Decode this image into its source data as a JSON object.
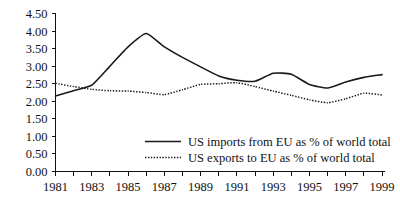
{
  "chart_data": {
    "type": "line",
    "title": "",
    "subtitle": "",
    "xlabel": "",
    "ylabel": "",
    "x": [
      1981,
      1982,
      1983,
      1984,
      1985,
      1986,
      1987,
      1988,
      1989,
      1990,
      1991,
      1992,
      1993,
      1994,
      1995,
      1996,
      1997,
      1998,
      1999
    ],
    "xlim": [
      1981,
      1999
    ],
    "ylim": [
      0.0,
      4.5
    ],
    "ytick_labels": [
      "0.00",
      "0.50",
      "1.00",
      "1.50",
      "2.00",
      "2.50",
      "3.00",
      "3.50",
      "4.00",
      "4.50"
    ],
    "ytick_values": [
      0.0,
      0.5,
      1.0,
      1.5,
      2.0,
      2.5,
      3.0,
      3.5,
      4.0,
      4.5
    ],
    "xtick_labels": [
      "1981",
      "1983",
      "1985",
      "1987",
      "1989",
      "1991",
      "1993",
      "1995",
      "1997",
      "1999"
    ],
    "xtick_values": [
      1981,
      1983,
      1985,
      1987,
      1989,
      1991,
      1993,
      1995,
      1997,
      1999
    ],
    "minor_xticks_every_year": true,
    "grid": false,
    "legend_position": "inside-center-lower",
    "series": [
      {
        "name": "US imports from EU as % of world total",
        "style": "solid",
        "color": "#1a1a1a",
        "values": [
          2.15,
          2.3,
          2.46,
          3.0,
          3.55,
          3.93,
          3.55,
          3.25,
          2.98,
          2.72,
          2.6,
          2.57,
          2.8,
          2.77,
          2.48,
          2.38,
          2.55,
          2.68,
          2.76
        ]
      },
      {
        "name": "US exports to EU as % of world total",
        "style": "dotted",
        "color": "#1a1a1a",
        "values": [
          2.51,
          2.42,
          2.34,
          2.3,
          2.29,
          2.25,
          2.19,
          2.33,
          2.48,
          2.5,
          2.53,
          2.42,
          2.29,
          2.17,
          2.04,
          1.96,
          2.07,
          2.23,
          2.18
        ]
      }
    ]
  },
  "legend": {
    "items": [
      {
        "label": "US imports from EU as % of world total",
        "style": "solid"
      },
      {
        "label": "US exports to EU as % of world total",
        "style": "dotted"
      }
    ]
  }
}
